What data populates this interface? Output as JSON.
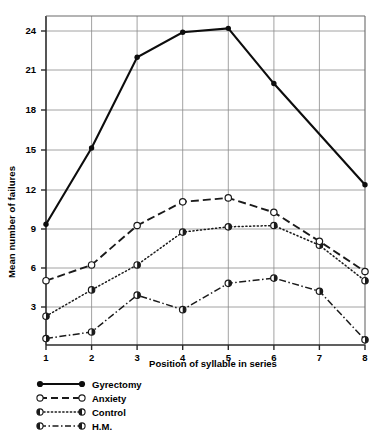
{
  "chart_data": {
    "type": "line",
    "title": "",
    "xlabel": "Position of syllable in series",
    "ylabel": "Mean number of failures",
    "x": [
      1,
      2,
      3,
      4,
      5,
      6,
      7,
      8
    ],
    "categories": [
      "1",
      "2",
      "3",
      "4",
      "5",
      "6",
      "7",
      "8"
    ],
    "xtick_labels": [
      "1",
      "2",
      "3",
      "4",
      "5",
      "6",
      "7",
      "8"
    ],
    "ytick_labels": [
      "3",
      "6",
      "9",
      "12",
      "15",
      "18",
      "21",
      "24"
    ],
    "ytick_values": [
      3,
      6,
      9,
      12,
      15,
      18,
      21,
      24
    ],
    "xlim": [
      1,
      8
    ],
    "ylim": [
      0,
      25.1
    ],
    "grid": "both",
    "legend_position": "below-left",
    "series": [
      {
        "name": "Gyrectomy",
        "line_style": "solid",
        "marker": "filled-circle",
        "color": "#000000",
        "values": [
          9.3,
          15.1,
          22.0,
          23.9,
          24.2,
          20.0,
          12.3,
          null
        ]
      },
      {
        "name": "Anxiety",
        "line_style": "dashed",
        "marker": "open-circle",
        "color": "#000000",
        "values": [
          5.0,
          6.2,
          9.2,
          11.0,
          11.3,
          10.2,
          8.0,
          5.7
        ]
      },
      {
        "name": "Control",
        "line_style": "dotted",
        "marker": "half-filled-circle",
        "color": "#000000",
        "values": [
          2.3,
          4.3,
          6.2,
          8.7,
          9.1,
          9.2,
          7.7,
          5.0
        ]
      },
      {
        "name": "H.M.",
        "line_style": "dash-dot",
        "marker": "half-filled-circle",
        "color": "#000000",
        "values": [
          0.6,
          1.1,
          3.9,
          2.8,
          4.8,
          5.2,
          4.2,
          0.5
        ]
      }
    ]
  },
  "legend": {
    "items": [
      {
        "label": "Gyrectomy",
        "key": "solid-filled-circle-key"
      },
      {
        "label": "Anxiety",
        "key": "dashed-open-circle-key"
      },
      {
        "label": "Control",
        "key": "dotted-half-circle-key"
      },
      {
        "label": "H.M.",
        "key": "dashdot-half-circle-key"
      }
    ]
  },
  "axes": {
    "y_title": "Mean number of failures",
    "x_title": "Position of syllable in series",
    "y_ticks": [
      "24",
      "21",
      "18",
      "15",
      "12",
      "9",
      "6",
      "3"
    ],
    "x_ticks": [
      "1",
      "2",
      "3",
      "4",
      "5",
      "6",
      "7",
      "8"
    ]
  }
}
